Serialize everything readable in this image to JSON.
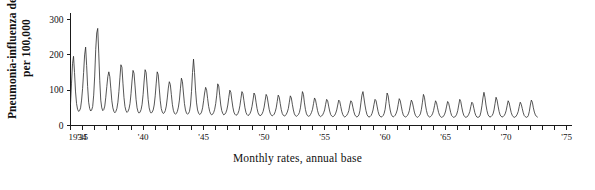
{
  "chart_data": {
    "type": "line",
    "title": "",
    "xlabel": "Monthly rates, annual base",
    "ylabel": "Pneumonia-influenza deaths per 100,000",
    "ylabel_lines": [
      "Pneumonia-influenza deaths",
      "per 100,000"
    ],
    "ylim": [
      0,
      320
    ],
    "yticks": [
      0,
      100,
      200,
      300
    ],
    "ytick_labels": [
      "0",
      "100",
      "200",
      "300"
    ],
    "xlim": [
      1934,
      1975.4
    ],
    "xticks": [
      1934,
      1935,
      1936,
      1937,
      1938,
      1939,
      1940,
      1941,
      1942,
      1943,
      1944,
      1945,
      1946,
      1947,
      1948,
      1949,
      1950,
      1951,
      1952,
      1953,
      1954,
      1955,
      1956,
      1957,
      1958,
      1959,
      1960,
      1961,
      1962,
      1963,
      1964,
      1965,
      1966,
      1967,
      1968,
      1969,
      1970,
      1971,
      1972,
      1973,
      1974,
      1975
    ],
    "xtick_labels": [
      {
        "x": 1934,
        "label": "1934"
      },
      {
        "x": 1935,
        "label": "'35"
      },
      {
        "x": 1940,
        "label": "'40"
      },
      {
        "x": 1945,
        "label": "'45"
      },
      {
        "x": 1950,
        "label": "'50"
      },
      {
        "x": 1955,
        "label": "'55"
      },
      {
        "x": 1960,
        "label": "'60"
      },
      {
        "x": 1965,
        "label": "'65"
      },
      {
        "x": 1970,
        "label": "'70"
      },
      {
        "x": 1975,
        "label": "'75"
      }
    ],
    "grid": false,
    "legend": false,
    "line_color": "#2b2b2b",
    "series": [
      {
        "name": "Pneumonia-influenza death rate",
        "x_start": 1934.0,
        "x_step": 0.08333,
        "values": [
          60,
          120,
          175,
          196,
          150,
          95,
          62,
          46,
          40,
          42,
          50,
          72,
          105,
          150,
          200,
          222,
          170,
          110,
          66,
          48,
          41,
          44,
          54,
          86,
          140,
          215,
          262,
          275,
          205,
          128,
          72,
          50,
          42,
          45,
          55,
          80,
          110,
          138,
          152,
          138,
          104,
          70,
          50,
          40,
          36,
          40,
          48,
          66,
          96,
          135,
          172,
          165,
          120,
          80,
          54,
          42,
          37,
          40,
          47,
          62,
          90,
          126,
          156,
          148,
          112,
          74,
          50,
          39,
          35,
          38,
          45,
          60,
          88,
          126,
          158,
          150,
          112,
          74,
          50,
          39,
          35,
          38,
          44,
          58,
          84,
          120,
          152,
          144,
          106,
          70,
          48,
          38,
          34,
          36,
          42,
          55,
          78,
          106,
          124,
          116,
          88,
          60,
          43,
          35,
          32,
          34,
          40,
          52,
          72,
          104,
          134,
          124,
          92,
          62,
          44,
          35,
          32,
          34,
          40,
          58,
          96,
          150,
          188,
          150,
          100,
          64,
          44,
          35,
          31,
          33,
          38,
          50,
          70,
          92,
          108,
          100,
          76,
          54,
          40,
          33,
          30,
          32,
          37,
          46,
          62,
          86,
          118,
          112,
          84,
          58,
          42,
          34,
          30,
          32,
          36,
          44,
          58,
          80,
          100,
          94,
          72,
          52,
          38,
          32,
          29,
          30,
          34,
          42,
          56,
          76,
          96,
          90,
          70,
          50,
          37,
          31,
          28,
          30,
          34,
          41,
          54,
          72,
          92,
          86,
          66,
          48,
          36,
          30,
          28,
          29,
          33,
          40,
          52,
          70,
          88,
          82,
          64,
          46,
          35,
          30,
          27,
          29,
          32,
          39,
          50,
          68,
          86,
          80,
          62,
          45,
          34,
          29,
          27,
          28,
          32,
          38,
          48,
          66,
          84,
          78,
          60,
          44,
          33,
          28,
          26,
          28,
          31,
          37,
          50,
          72,
          96,
          88,
          64,
          45,
          33,
          28,
          26,
          27,
          31,
          37,
          46,
          62,
          78,
          72,
          57,
          42,
          32,
          27,
          25,
          27,
          30,
          36,
          44,
          60,
          74,
          70,
          55,
          41,
          31,
          27,
          25,
          26,
          29,
          35,
          44,
          58,
          72,
          68,
          54,
          40,
          31,
          26,
          24,
          26,
          29,
          34,
          42,
          58,
          70,
          66,
          52,
          39,
          30,
          26,
          24,
          26,
          30,
          42,
          64,
          86,
          96,
          78,
          58,
          42,
          31,
          26,
          24,
          25,
          28,
          34,
          44,
          60,
          74,
          70,
          55,
          40,
          30,
          26,
          24,
          25,
          28,
          34,
          46,
          68,
          92,
          84,
          62,
          44,
          32,
          27,
          24,
          26,
          29,
          35,
          44,
          60,
          76,
          70,
          55,
          40,
          30,
          26,
          24,
          25,
          28,
          33,
          42,
          58,
          72,
          66,
          52,
          38,
          29,
          25,
          23,
          25,
          28,
          33,
          46,
          66,
          88,
          80,
          58,
          42,
          31,
          26,
          24,
          25,
          28,
          33,
          42,
          56,
          70,
          64,
          50,
          37,
          29,
          25,
          23,
          24,
          27,
          32,
          41,
          55,
          68,
          63,
          50,
          37,
          28,
          25,
          23,
          24,
          27,
          32,
          42,
          58,
          74,
          68,
          52,
          38,
          29,
          25,
          23,
          24,
          27,
          32,
          40,
          54,
          66,
          62,
          49,
          36,
          28,
          24,
          23,
          24,
          27,
          38,
          56,
          78,
          94,
          80,
          58,
          42,
          31,
          26,
          24,
          25,
          28,
          33,
          44,
          62,
          80,
          72,
          55,
          40,
          30,
          26,
          24,
          25,
          28,
          33,
          42,
          56,
          70,
          64,
          50,
          37,
          29,
          25,
          23,
          24,
          27,
          32,
          40,
          54,
          66,
          60,
          48,
          36,
          28,
          25,
          23,
          24,
          28,
          40,
          58,
          72,
          66,
          50,
          38,
          30,
          26,
          24
        ]
      }
    ],
    "annotations": [
      {
        "text": "tallest peak near 1936 winter",
        "value": 275
      },
      {
        "text": "sharp spike near 1943",
        "value": 188
      },
      {
        "text": "series ends near 1972",
        "value": 24
      }
    ]
  },
  "axes": {
    "y_axis_name": "pneumonia-influenza-rate-axis",
    "x_axis_name": "year-axis"
  }
}
